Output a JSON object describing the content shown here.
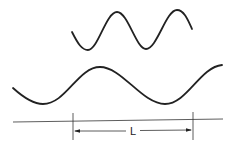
{
  "diagram": {
    "waves": [
      {
        "name": "short-wavelength-wave",
        "wavelength_px": 60,
        "cycles_shown": 2
      },
      {
        "name": "long-wavelength-wave",
        "wavelength_px": 122,
        "cycles_shown": 1.7
      }
    ],
    "dimension": {
      "label": "L"
    },
    "colors": {
      "stroke": "#222222",
      "background": "#ffffff"
    }
  }
}
